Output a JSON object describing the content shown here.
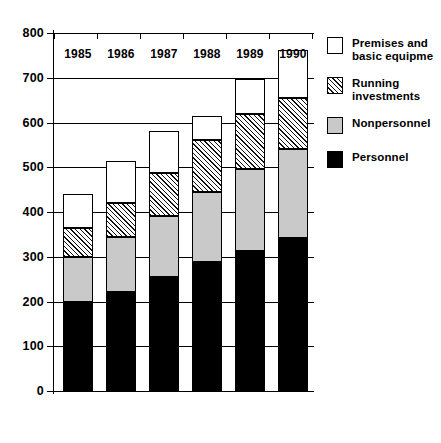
{
  "chart_data": {
    "type": "bar",
    "subtype": "stacked-vertical",
    "title": "",
    "xlabel": "",
    "ylabel": "",
    "categories": [
      "1985",
      "1986",
      "1987",
      "1988",
      "1989",
      "1990"
    ],
    "series": [
      {
        "name": "Personnel",
        "key": "personnel",
        "values": [
          198,
          222,
          255,
          289,
          313,
          343
        ]
      },
      {
        "name": "Nonpersonnel",
        "key": "nonpersonnel",
        "values": [
          101,
          123,
          135,
          155,
          184,
          197
        ]
      },
      {
        "name": "Running investments",
        "key": "running",
        "values": [
          66,
          75,
          97,
          116,
          123,
          115
        ]
      },
      {
        "name": "Premises and basic equipme",
        "key": "premises",
        "values": [
          76,
          93,
          93,
          55,
          78,
          108
        ]
      }
    ],
    "cumulative_tops": [
      {
        "category": "1985",
        "personnel": 198,
        "nonpersonnel": 299,
        "running": 365,
        "premises": 441
      },
      {
        "category": "1986",
        "personnel": 222,
        "nonpersonnel": 345,
        "running": 420,
        "premises": 513
      },
      {
        "category": "1987",
        "personnel": 255,
        "nonpersonnel": 390,
        "running": 487,
        "premises": 580
      },
      {
        "category": "1988",
        "personnel": 289,
        "nonpersonnel": 444,
        "running": 560,
        "premises": 615
      },
      {
        "category": "1989",
        "personnel": 313,
        "nonpersonnel": 497,
        "running": 620,
        "premises": 698
      },
      {
        "category": "1990",
        "personnel": 343,
        "nonpersonnel": 540,
        "running": 655,
        "premises": 763
      }
    ],
    "totals": [
      441,
      513,
      580,
      615,
      698,
      763
    ],
    "ylim": [
      0,
      800
    ],
    "ytick_step": 100,
    "yticks": [
      0,
      100,
      200,
      300,
      400,
      500,
      600,
      700,
      800
    ],
    "ytick_labels": [
      "0",
      "100",
      "200",
      "300",
      "400",
      "500",
      "600",
      "700",
      "800"
    ],
    "grid": true,
    "grid_axis": "y",
    "legend_position": "right",
    "legend_entries": [
      "Premises and basic equipme",
      "Running investments",
      "Nonpersonnel",
      "Personnel"
    ],
    "colors": {
      "personnel": "#000000",
      "nonpersonnel": "#c9c9c9",
      "running": "#ffffff",
      "premises": "#ffffff",
      "axis": "#000000",
      "grid": "#000000",
      "background": "#ffffff"
    }
  },
  "legend": {
    "items": [
      {
        "label_line1": "Premises and",
        "label_line2": "basic equipme",
        "swatch": "premises"
      },
      {
        "label_line1": "Running",
        "label_line2": "investments",
        "swatch": "running"
      },
      {
        "label_line1": "Nonpersonnel",
        "label_line2": "",
        "swatch": "nonpersonnel"
      },
      {
        "label_line1": "Personnel",
        "label_line2": "",
        "swatch": "personnel"
      }
    ]
  }
}
